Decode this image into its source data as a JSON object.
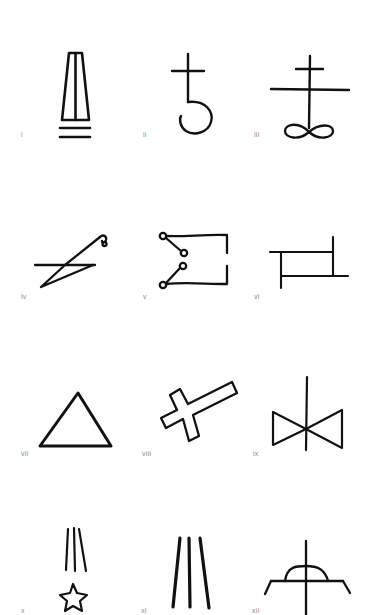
{
  "figure": {
    "ink_color": "#111111",
    "label_color": "#8a8a8a",
    "background": "#ffffff",
    "symbols": [
      {
        "label": "i",
        "icon": "tapered-pillar-over-double-bar-icon"
      },
      {
        "label": "ii",
        "icon": "cross-with-hook-icon"
      },
      {
        "label": "iii",
        "icon": "double-cross-over-infinity-icon"
      },
      {
        "label": "iv",
        "icon": "zigzag-with-curl-icon"
      },
      {
        "label": "v",
        "icon": "bracket-with-circled-nodes-icon"
      },
      {
        "label": "vi",
        "icon": "offset-rectangle-icon"
      },
      {
        "label": "vii",
        "icon": "triangle-icon"
      },
      {
        "label": "viii",
        "icon": "tilted-outline-cross-icon"
      },
      {
        "label": "ix",
        "icon": "bowtie-with-vertical-line-icon"
      },
      {
        "label": "x",
        "icon": "falling-star-icon"
      },
      {
        "label": "xi",
        "icon": "three-lines-icon"
      },
      {
        "label": "xii",
        "icon": "semicircle-on-cross-icon"
      }
    ]
  }
}
